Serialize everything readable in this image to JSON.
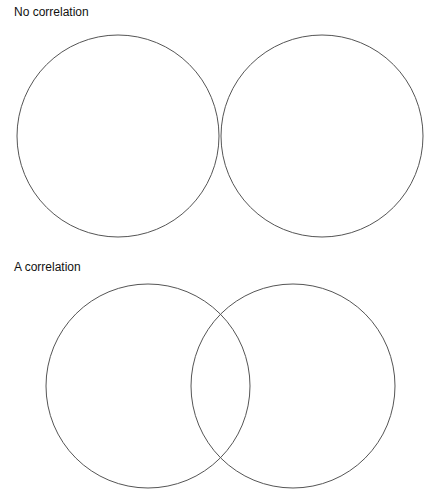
{
  "panels": [
    {
      "title": "No correlation",
      "title_pos": [
        14,
        4
      ],
      "circles": [
        {
          "cx": 118,
          "cy": 136,
          "r": 101
        },
        {
          "cx": 322,
          "cy": 136,
          "r": 101
        }
      ]
    },
    {
      "title": "A correlation",
      "title_pos": [
        14,
        258
      ],
      "circles": [
        {
          "cx": 148,
          "cy": 386,
          "r": 102
        },
        {
          "cx": 293,
          "cy": 386,
          "r": 102
        }
      ]
    }
  ],
  "stroke_color": "#555555"
}
